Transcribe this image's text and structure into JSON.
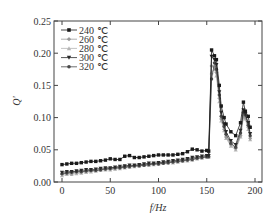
{
  "chart_data": {
    "type": "line",
    "title": "",
    "xlabel": "f/Hz",
    "ylabel": "Q'",
    "xlim": [
      -6,
      208
    ],
    "ylim": [
      0,
      0.25
    ],
    "xticks": [
      0,
      50,
      100,
      150,
      200
    ],
    "xtick_labels": [
      "0",
      "50",
      "100",
      "150",
      "200"
    ],
    "yticks": [
      0.0,
      0.05,
      0.1,
      0.15,
      0.2,
      0.25
    ],
    "ytick_labels": [
      "0.00",
      "0.05",
      "0.10",
      "0.15",
      "0.20",
      "0.25"
    ],
    "grid": false,
    "legend_position": "upper left",
    "x": [
      0,
      5,
      10,
      15,
      20,
      25,
      30,
      35,
      40,
      45,
      50,
      55,
      60,
      65,
      70,
      75,
      80,
      85,
      90,
      95,
      100,
      105,
      110,
      115,
      120,
      125,
      130,
      135,
      140,
      145,
      150,
      152,
      155,
      158,
      160,
      163,
      165,
      168,
      170,
      175,
      180,
      185,
      188,
      190,
      193,
      195
    ],
    "series": [
      {
        "name": "240 ℃",
        "marker": "square",
        "color": "#1a1a1a",
        "values": [
          0.027,
          0.028,
          0.029,
          0.029,
          0.03,
          0.031,
          0.032,
          0.032,
          0.033,
          0.034,
          0.036,
          0.035,
          0.035,
          0.04,
          0.041,
          0.038,
          0.038,
          0.039,
          0.04,
          0.041,
          0.042,
          0.042,
          0.042,
          0.042,
          0.043,
          0.044,
          0.047,
          0.051,
          0.05,
          0.048,
          0.049,
          0.048,
          0.205,
          0.196,
          0.19,
          0.15,
          0.118,
          0.1,
          0.09,
          0.078,
          0.072,
          0.092,
          0.124,
          0.11,
          0.102,
          0.085
        ]
      },
      {
        "name": "260 ℃",
        "marker": "diamond",
        "color": "#9a9a9a",
        "values": [
          0.012,
          0.014,
          0.013,
          0.015,
          0.016,
          0.017,
          0.017,
          0.018,
          0.019,
          0.02,
          0.02,
          0.021,
          0.022,
          0.024,
          0.024,
          0.025,
          0.026,
          0.027,
          0.027,
          0.028,
          0.029,
          0.03,
          0.03,
          0.031,
          0.032,
          0.033,
          0.034,
          0.036,
          0.037,
          0.038,
          0.04,
          0.04,
          0.18,
          0.178,
          0.17,
          0.13,
          0.098,
          0.082,
          0.07,
          0.058,
          0.052,
          0.072,
          0.104,
          0.1,
          0.085,
          0.068
        ]
      },
      {
        "name": "280 ℃",
        "marker": "triangle-up",
        "color": "#b5b5b5",
        "values": [
          0.01,
          0.012,
          0.012,
          0.013,
          0.014,
          0.015,
          0.016,
          0.017,
          0.018,
          0.019,
          0.019,
          0.02,
          0.021,
          0.022,
          0.023,
          0.024,
          0.025,
          0.026,
          0.026,
          0.027,
          0.028,
          0.029,
          0.03,
          0.03,
          0.031,
          0.032,
          0.033,
          0.034,
          0.036,
          0.037,
          0.039,
          0.039,
          0.17,
          0.175,
          0.165,
          0.125,
          0.095,
          0.08,
          0.068,
          0.056,
          0.05,
          0.07,
          0.1,
          0.098,
          0.082,
          0.066
        ]
      },
      {
        "name": "300 ℃",
        "marker": "triangle-down",
        "color": "#2a2a2a",
        "values": [
          0.015,
          0.016,
          0.016,
          0.017,
          0.018,
          0.019,
          0.019,
          0.02,
          0.021,
          0.022,
          0.022,
          0.023,
          0.024,
          0.025,
          0.026,
          0.026,
          0.027,
          0.028,
          0.029,
          0.029,
          0.03,
          0.031,
          0.032,
          0.033,
          0.034,
          0.035,
          0.036,
          0.038,
          0.039,
          0.04,
          0.041,
          0.041,
          0.195,
          0.19,
          0.182,
          0.14,
          0.108,
          0.09,
          0.078,
          0.064,
          0.058,
          0.08,
          0.112,
          0.106,
          0.092,
          0.075
        ]
      },
      {
        "name": "320 ℃",
        "marker": "circle",
        "color": "#4a4a4a",
        "values": [
          0.013,
          0.014,
          0.015,
          0.016,
          0.016,
          0.017,
          0.018,
          0.018,
          0.019,
          0.02,
          0.021,
          0.022,
          0.022,
          0.023,
          0.024,
          0.025,
          0.025,
          0.026,
          0.027,
          0.028,
          0.028,
          0.029,
          0.03,
          0.031,
          0.032,
          0.033,
          0.034,
          0.035,
          0.037,
          0.038,
          0.039,
          0.039,
          0.16,
          0.185,
          0.175,
          0.135,
          0.102,
          0.086,
          0.074,
          0.06,
          0.054,
          0.076,
          0.108,
          0.104,
          0.088,
          0.072
        ]
      }
    ]
  }
}
